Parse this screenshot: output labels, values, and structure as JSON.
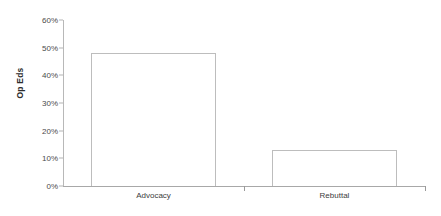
{
  "chart_data": {
    "type": "bar",
    "title": "",
    "subtitle": "",
    "xlabel": "",
    "ylabel": "Op Eds",
    "categories": [
      "Advocacy",
      "Rebuttal"
    ],
    "values": [
      48,
      13
    ],
    "value_labels": [
      "48%",
      "13%"
    ],
    "ylim": [
      0,
      60
    ],
    "y_ticks": [
      0,
      10,
      20,
      30,
      40,
      50,
      60
    ],
    "y_tick_labels": [
      "0%",
      "10%",
      "20%",
      "30%",
      "40%",
      "50%",
      "60%"
    ],
    "grid": false,
    "legend": false,
    "legend_position": "none",
    "series": [
      {
        "name": "Op Eds",
        "values": [
          48,
          13
        ]
      }
    ],
    "colors": {
      "bar_fill": "#ffffff",
      "bar_border": "#bdbdbd",
      "axis": "#b0b0b0",
      "text": "#3a3a3a",
      "background": "#ffffff"
    }
  }
}
